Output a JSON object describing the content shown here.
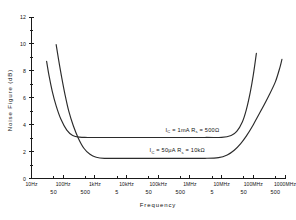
{
  "chart_data": {
    "type": "line",
    "title": "",
    "xlabel": "Frequency",
    "ylabel": "Noise Figure (dB)",
    "xscale": "log",
    "xlim": [
      10,
      1000000000
    ],
    "ylim": [
      0,
      12
    ],
    "grid": false,
    "legend": "none",
    "y_ticks": [
      "0",
      "2",
      "4",
      "6",
      "8",
      "10",
      "12"
    ],
    "y_tick_values": [
      0,
      2,
      4,
      6,
      8,
      10,
      12
    ],
    "x_ticks_major": [
      "10Hz",
      "100Hz",
      "1kHz",
      "10kHz",
      "100kHz",
      "1MHz",
      "10MHz",
      "100MHz",
      "1000MHz"
    ],
    "x_tick_major_values": [
      10,
      100,
      1000,
      10000,
      100000,
      1000000,
      10000000,
      100000000,
      1000000000
    ],
    "x_ticks_minor": [
      "50",
      "500",
      "5",
      "50",
      "500",
      "5",
      "50",
      "500"
    ],
    "x_tick_minor_values": [
      50,
      500,
      5000,
      50000,
      500000,
      5000000,
      50000000,
      500000000
    ],
    "series": [
      {
        "name": "Ic = 1mA, Rs = 500 ohm",
        "plateau": 3.05,
        "points": [
          [
            30,
            8.7
          ],
          [
            36,
            7.6
          ],
          [
            45,
            6.5
          ],
          [
            60,
            5.4
          ],
          [
            85,
            4.4
          ],
          [
            130,
            3.6
          ],
          [
            200,
            3.2
          ],
          [
            330,
            3.07
          ],
          [
            600,
            3.05
          ],
          [
            3000,
            3.05
          ],
          [
            100000,
            3.05
          ],
          [
            3000000,
            3.05
          ],
          [
            10000000,
            3.06
          ],
          [
            20000000,
            3.2
          ],
          [
            30000000,
            3.5
          ],
          [
            45000000,
            4.2
          ],
          [
            60000000,
            5.1
          ],
          [
            80000000,
            6.4
          ],
          [
            100000000,
            7.7
          ],
          [
            125000000,
            9.3
          ]
        ]
      },
      {
        "name": "Ic = 50uA, Rs = 10k ohm",
        "plateau": 1.5,
        "points": [
          [
            60,
            9.95
          ],
          [
            72,
            8.8
          ],
          [
            90,
            7.5
          ],
          [
            115,
            6.2
          ],
          [
            150,
            5.0
          ],
          [
            210,
            3.9
          ],
          [
            300,
            3.0
          ],
          [
            450,
            2.25
          ],
          [
            700,
            1.8
          ],
          [
            1100,
            1.58
          ],
          [
            2000,
            1.5
          ],
          [
            10000,
            1.5
          ],
          [
            500000,
            1.5
          ],
          [
            3000000,
            1.5
          ],
          [
            8000000,
            1.55
          ],
          [
            15000000,
            1.75
          ],
          [
            25000000,
            2.1
          ],
          [
            40000000,
            2.6
          ],
          [
            60000000,
            3.15
          ],
          [
            100000000,
            4.0
          ],
          [
            180000000,
            5.1
          ],
          [
            300000000,
            6.1
          ],
          [
            500000000,
            7.2
          ],
          [
            700000000,
            8.3
          ],
          [
            800000000,
            8.85
          ]
        ]
      }
    ],
    "annotations": [
      {
        "id": "annotation-upper",
        "text": "I_C = 1mA   R_s = 500Ω",
        "parts": [
          "I",
          "C",
          " = 1mA   R",
          "s",
          " = 500Ω"
        ],
        "x": 1200000,
        "y": 3.45
      },
      {
        "id": "annotation-lower",
        "text": "I_C = 50μA   R_s = 10kΩ",
        "parts": [
          "I",
          "C",
          " = 50μA   R",
          "s",
          " = 10kΩ"
        ],
        "x": 400000,
        "y": 1.95
      }
    ],
    "colors": {
      "curve": "#2b2b2b",
      "axis": "#1a1a1a",
      "background": "#ffffff"
    }
  }
}
